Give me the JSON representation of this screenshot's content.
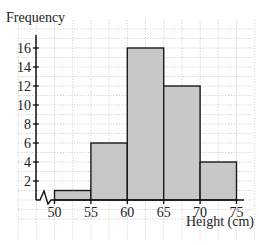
{
  "chart_data": {
    "type": "bar",
    "subtype": "histogram",
    "title": "",
    "xlabel": "Height (cm)",
    "ylabel": "Frequency",
    "bins": [
      {
        "from": 50,
        "to": 55,
        "frequency": 1
      },
      {
        "from": 55,
        "to": 60,
        "frequency": 6
      },
      {
        "from": 60,
        "to": 65,
        "frequency": 16
      },
      {
        "from": 65,
        "to": 70,
        "frequency": 12
      },
      {
        "from": 70,
        "to": 75,
        "frequency": 4
      }
    ],
    "categories": [
      "50-55",
      "55-60",
      "60-65",
      "65-70",
      "70-75"
    ],
    "values": [
      1,
      6,
      16,
      12,
      4
    ],
    "x_ticks": [
      50,
      55,
      60,
      65,
      70,
      75
    ],
    "y_ticks": [
      2,
      4,
      6,
      8,
      10,
      12,
      14,
      16
    ],
    "xlim": [
      50,
      75
    ],
    "ylim": [
      0,
      16
    ],
    "x_axis_break": true,
    "grid": true,
    "legend": null,
    "colors": {
      "bar_fill": "#c8c8c8",
      "bar_stroke": "#1a1a1a",
      "grid": "#bdbdbd",
      "axis": "#111111"
    }
  }
}
